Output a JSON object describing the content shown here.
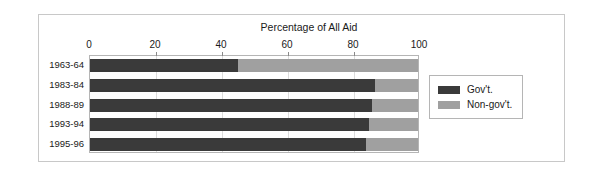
{
  "chart_data": {
    "type": "bar",
    "subtype": "stacked-horizontal-100pct",
    "title": "Percentage of All Aid",
    "xlabel": "",
    "ylabel": "",
    "xlim": [
      0,
      100
    ],
    "xticks": [
      0,
      20,
      40,
      60,
      80,
      100
    ],
    "grid": true,
    "legend_position": "right",
    "categories": [
      "1963-64",
      "1983-84",
      "1988-89",
      "1993-94",
      "1995-96"
    ],
    "series": [
      {
        "name": "Gov't.",
        "color": "#3a3a3a",
        "values": [
          45,
          87,
          86,
          85,
          84
        ]
      },
      {
        "name": "Non-gov't.",
        "color": "#a0a0a0",
        "values": [
          55,
          13,
          14,
          15,
          16
        ]
      }
    ]
  },
  "legend": {
    "entries": [
      {
        "label": "Gov't."
      },
      {
        "label": "Non-gov't."
      }
    ]
  },
  "colors": {
    "gov": "#3a3a3a",
    "nongov": "#a0a0a0",
    "frame": "#c8c8c8",
    "plot_border": "#b5b5b5",
    "gridline": "#dcdcdc",
    "text": "#1a1a1a"
  }
}
